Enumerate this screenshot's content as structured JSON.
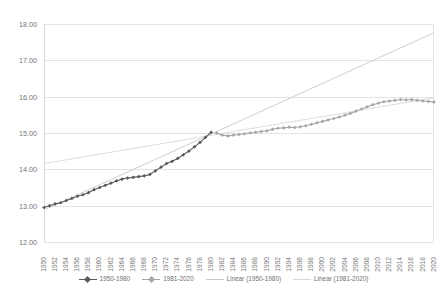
{
  "chart_data": {
    "type": "line",
    "title": "",
    "subtitle": "",
    "xlabel": "",
    "ylabel": "",
    "ylim": [
      12.0,
      18.0
    ],
    "ytick_step": 1.0,
    "ytick_labels": [
      "18.00",
      "17.00",
      "16.00",
      "15.00",
      "14.00",
      "13.00",
      "12.00"
    ],
    "ytick_values": [
      18.0,
      17.0,
      16.0,
      15.0,
      14.0,
      13.0,
      12.0
    ],
    "xlim": [
      1950,
      2020
    ],
    "xtick_labels": [
      "1950",
      "1952",
      "1954",
      "1956",
      "1958",
      "1960",
      "1962",
      "1964",
      "1966",
      "1968",
      "1970",
      "1972",
      "1974",
      "1976",
      "1978",
      "1980",
      "1982",
      "1984",
      "1986",
      "1988",
      "1990",
      "1992",
      "1994",
      "1996",
      "1998",
      "2000",
      "2002",
      "2004",
      "2006",
      "2008",
      "2010",
      "2012",
      "2014",
      "2016",
      "2018",
      "2020"
    ],
    "xtick_values": [
      1950,
      1952,
      1954,
      1956,
      1958,
      1960,
      1962,
      1964,
      1966,
      1968,
      1970,
      1972,
      1974,
      1976,
      1978,
      1980,
      1982,
      1984,
      1986,
      1988,
      1990,
      1992,
      1994,
      1996,
      1998,
      2000,
      2002,
      2004,
      2006,
      2008,
      2010,
      2012,
      2014,
      2016,
      2018,
      2020
    ],
    "grid": true,
    "grid_axis": "y",
    "legend_position": "bottom",
    "series": [
      {
        "name": "1950-1980",
        "kind": "line-markers",
        "color": "#595959",
        "marker": "diamond",
        "x": [
          1950,
          1951,
          1952,
          1953,
          1954,
          1955,
          1956,
          1957,
          1958,
          1959,
          1960,
          1961,
          1962,
          1963,
          1964,
          1965,
          1966,
          1967,
          1968,
          1969,
          1970,
          1971,
          1972,
          1973,
          1974,
          1975,
          1976,
          1977,
          1978,
          1979,
          1980
        ],
        "values": [
          12.95,
          13.0,
          13.05,
          13.08,
          13.14,
          13.2,
          13.26,
          13.3,
          13.36,
          13.44,
          13.5,
          13.56,
          13.62,
          13.68,
          13.73,
          13.76,
          13.78,
          13.8,
          13.82,
          13.86,
          13.96,
          14.06,
          14.16,
          14.22,
          14.3,
          14.4,
          14.5,
          14.62,
          14.74,
          14.88,
          15.02
        ]
      },
      {
        "name": "1981-2020",
        "kind": "line-markers",
        "color": "#a6a6a6",
        "marker": "diamond",
        "x": [
          1981,
          1982,
          1983,
          1984,
          1985,
          1986,
          1987,
          1988,
          1989,
          1990,
          1991,
          1992,
          1993,
          1994,
          1995,
          1996,
          1997,
          1998,
          1999,
          2000,
          2001,
          2002,
          2003,
          2004,
          2005,
          2006,
          2007,
          2008,
          2009,
          2010,
          2011,
          2012,
          2013,
          2014,
          2015,
          2016,
          2017,
          2018,
          2019,
          2020
        ],
        "values": [
          15.0,
          14.94,
          14.92,
          14.94,
          14.96,
          14.98,
          15.0,
          15.02,
          15.04,
          15.06,
          15.1,
          15.13,
          15.14,
          15.16,
          15.15,
          15.17,
          15.2,
          15.24,
          15.28,
          15.32,
          15.36,
          15.4,
          15.44,
          15.49,
          15.54,
          15.6,
          15.66,
          15.72,
          15.78,
          15.82,
          15.86,
          15.88,
          15.9,
          15.92,
          15.91,
          15.92,
          15.9,
          15.88,
          15.87,
          15.85
        ]
      }
    ],
    "trendlines": [
      {
        "name": "Linear (1950-1980)",
        "color": "#c9c9c9",
        "x_start": 1950,
        "y_start": 12.88,
        "x_end": 2020,
        "y_end": 17.76
      },
      {
        "name": "Linear (1981-2020)",
        "color": "#d8d8d8",
        "x_start": 1950,
        "y_start": 14.16,
        "x_end": 2020,
        "y_end": 15.97
      }
    ],
    "legend": [
      {
        "label": "1950-1980",
        "color": "#595959",
        "marker": true
      },
      {
        "label": "1981-2020",
        "color": "#a6a6a6",
        "marker": true
      },
      {
        "label": "Linear (1950-1980)",
        "color": "#c9c9c9",
        "marker": false
      },
      {
        "label": "Linear (1981-2020)",
        "color": "#d8d8d8",
        "marker": false
      }
    ]
  }
}
